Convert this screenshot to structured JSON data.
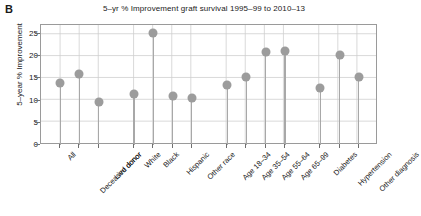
{
  "panel": {
    "letter": "B"
  },
  "chart_data": {
    "type": "scatter",
    "title": "5–yr % Improvement graft survival 1995–99 to 2010–13",
    "xlabel": "",
    "ylabel": "5–year % Improvement",
    "ylim": [
      0,
      27
    ],
    "yticks": [
      0,
      5,
      10,
      15,
      20,
      25
    ],
    "ytick_labels": [
      "0",
      "5",
      "10",
      "15",
      "20",
      "25"
    ],
    "grid": true,
    "legend": "none",
    "marker": "filled-circle-with-stem",
    "marker_color": "#9c9c9c",
    "categories": [
      "All",
      "Deceased donor",
      "Live donor",
      "White",
      "Black",
      "Hispanic",
      "Other race",
      "Age 18–34",
      "Age 35–54",
      "Age 55–64",
      "Age 65–99",
      "Diabetes",
      "Hypertension",
      "Other diagnosis"
    ],
    "values": [
      14.0,
      16.0,
      9.6,
      11.4,
      25.2,
      11.1,
      10.5,
      13.6,
      15.3,
      21.0,
      21.2,
      12.8,
      20.2,
      15.3
    ],
    "gaps_after": [
      2,
      6,
      10
    ]
  }
}
